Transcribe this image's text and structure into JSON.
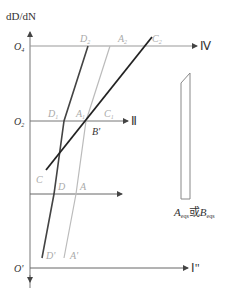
{
  "axis": {
    "y_title": "dD/dN",
    "origins": [
      "O4",
      "O2",
      "O'"
    ]
  },
  "levels": [
    {
      "origin": "O4",
      "origin_sub": "4",
      "roman": "Ⅳ",
      "points": [
        "D2",
        "A2",
        "C2"
      ]
    },
    {
      "origin": "O2",
      "origin_sub": "2",
      "roman": "Ⅱ",
      "points": [
        "D1",
        "A1",
        "C1"
      ]
    },
    {
      "origin": "",
      "roman": "",
      "points": [
        "C",
        "D",
        "A"
      ]
    },
    {
      "origin": "O'",
      "roman": "Ⅰ'",
      "points": [
        "D'",
        "A'"
      ]
    }
  ],
  "labels": {
    "o4": "O",
    "o4_sub": "4",
    "o2": "O",
    "o2_sub": "2",
    "o_prime": "O'",
    "iv": "Ⅳ",
    "ii": "Ⅱ",
    "i_prime": "Ⅰ''",
    "d2": "D",
    "d2_sub": "2",
    "a2": "A",
    "a2_sub": "2",
    "c2": "C",
    "c2_sub": "2",
    "d1": "D",
    "d1_sub": "1",
    "a1": "A",
    "a1_sub": "1",
    "c1": "C",
    "c1_sub": "1",
    "b_prime": "B'",
    "c": "C",
    "d": "D",
    "a": "A",
    "d_prime": "D'",
    "a_prime": "A'"
  },
  "caption": {
    "a": "A",
    "a_sub": "eqs",
    "or": "或",
    "b": "B",
    "b_sub": "eqs"
  },
  "colors": {
    "dark_line": "#333333",
    "light_line": "#b8b8b8",
    "axis": "#555555"
  }
}
